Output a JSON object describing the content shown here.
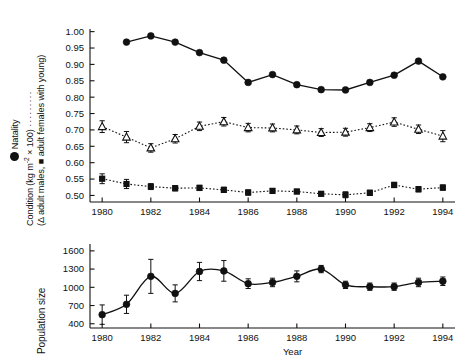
{
  "figure": {
    "background": "#ffffff",
    "line_color": "#111111",
    "marker_color": "#111111"
  },
  "top_panel": {
    "y_axis": {
      "title_line1": "Natality",
      "title_line2_pre": "Condition (kg m",
      "title_line2_sup": "-2",
      "title_line2_post": " × 100) ",
      "title_line2_dots": "·········",
      "title_line3": "(Δ adult males, ■ adult females with young)",
      "ticks": [
        "1.00",
        "0.95",
        "0.90",
        "0.85",
        "0.80",
        "0.75",
        "0.70",
        "0.65",
        "0.60",
        "0.55",
        "0.50"
      ]
    },
    "x_axis": {
      "ticks": [
        "1980",
        "1982",
        "1984",
        "1986",
        "1988",
        "1990",
        "1992",
        "1994"
      ]
    }
  },
  "bottom_panel": {
    "y_axis": {
      "title": "Population size",
      "ticks": [
        "1600",
        "1300",
        "1000",
        "700",
        "400"
      ]
    },
    "x_axis": {
      "title": "Year",
      "ticks": [
        "1980",
        "1982",
        "1984",
        "1986",
        "1988",
        "1990",
        "1992",
        "1994"
      ]
    }
  },
  "chart_data": [
    {
      "type": "line",
      "title": "",
      "xlabel": "",
      "ylabel": "Natality / Condition (kg m-2 x 100)",
      "xlim": [
        1979.5,
        1994.5
      ],
      "ylim": [
        0.48,
        1.005
      ],
      "grid": false,
      "legend": "in y-axis label",
      "x": [
        1980,
        1981,
        1982,
        1983,
        1984,
        1985,
        1986,
        1987,
        1988,
        1989,
        1990,
        1991,
        1992,
        1993,
        1994
      ],
      "series": [
        {
          "name": "Natality",
          "marker": "filled-circle",
          "linestyle": "solid",
          "values": [
            null,
            0.968,
            0.987,
            0.968,
            0.936,
            0.913,
            0.845,
            0.869,
            0.838,
            0.823,
            0.822,
            0.845,
            0.867,
            0.91,
            0.862
          ],
          "errors": null
        },
        {
          "name": "Condition - adult males",
          "marker": "open-triangle",
          "linestyle": "dotted",
          "values": [
            0.71,
            0.678,
            0.645,
            0.673,
            0.711,
            0.725,
            0.707,
            0.706,
            0.7,
            0.692,
            0.693,
            0.707,
            0.724,
            0.702,
            0.681
          ],
          "errors": [
            0.018,
            0.017,
            0.013,
            0.013,
            0.013,
            0.013,
            0.013,
            0.012,
            0.012,
            0.012,
            0.012,
            0.012,
            0.013,
            0.013,
            0.017
          ]
        },
        {
          "name": "Condition - adult females with young",
          "marker": "filled-square",
          "linestyle": "dotted",
          "values": [
            0.551,
            0.535,
            0.527,
            0.522,
            0.523,
            0.517,
            0.509,
            0.514,
            0.512,
            0.505,
            0.502,
            0.508,
            0.532,
            0.519,
            0.524
          ],
          "errors": [
            0.015,
            0.014,
            0.009,
            0.008,
            0.008,
            0.008,
            0.008,
            0.007,
            0.007,
            0.007,
            0.009,
            0.008,
            0.008,
            0.008,
            0.008
          ]
        }
      ]
    },
    {
      "type": "line",
      "title": "",
      "xlabel": "Year",
      "ylabel": "Population size",
      "xlim": [
        1979.5,
        1994.5
      ],
      "ylim": [
        330,
        1680
      ],
      "grid": false,
      "x": [
        1980,
        1981,
        1982,
        1983,
        1984,
        1985,
        1986,
        1987,
        1988,
        1989,
        1990,
        1991,
        1992,
        1993,
        1994
      ],
      "series": [
        {
          "name": "Population size",
          "marker": "filled-circle",
          "linestyle": "solid",
          "values": [
            550,
            720,
            1180,
            900,
            1260,
            1270,
            1060,
            1080,
            1180,
            1300,
            1040,
            1010,
            1010,
            1080,
            1100
          ],
          "errors": [
            160,
            150,
            280,
            140,
            150,
            170,
            80,
            70,
            90,
            60,
            60,
            60,
            60,
            70,
            70
          ]
        }
      ]
    }
  ]
}
